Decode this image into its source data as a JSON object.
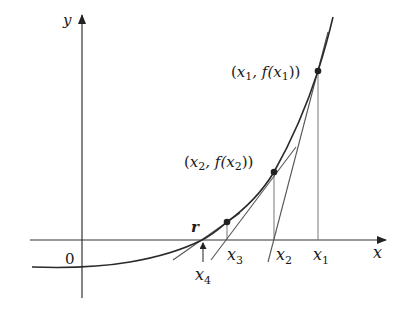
{
  "diagram": {
    "axes": {
      "x_label": "x",
      "y_label": "y",
      "origin_label": "0"
    },
    "root_label": "r",
    "points": [
      {
        "name": "x1",
        "base": "x",
        "sub": "1",
        "label": "(x1, f(x1))"
      },
      {
        "name": "x2",
        "base": "x",
        "sub": "2",
        "label": "(x2, f(x2))"
      },
      {
        "name": "x3",
        "base": "x",
        "sub": "3"
      },
      {
        "name": "x4",
        "base": "x",
        "sub": "4"
      }
    ],
    "point_labels": {
      "p1": {
        "open": "(",
        "x": "x",
        "sub": "1",
        "mid": ", f(",
        "x2": "x",
        "sub2": "1",
        "close": "))"
      },
      "p2": {
        "open": "(",
        "x": "x",
        "sub": "2",
        "mid": ", f(",
        "x2": "x",
        "sub2": "2",
        "close": "))"
      }
    },
    "colors": {
      "curve": "#2a2a2a",
      "axis": "#333333",
      "tangent": "#555555",
      "vertical": "#777777"
    }
  }
}
